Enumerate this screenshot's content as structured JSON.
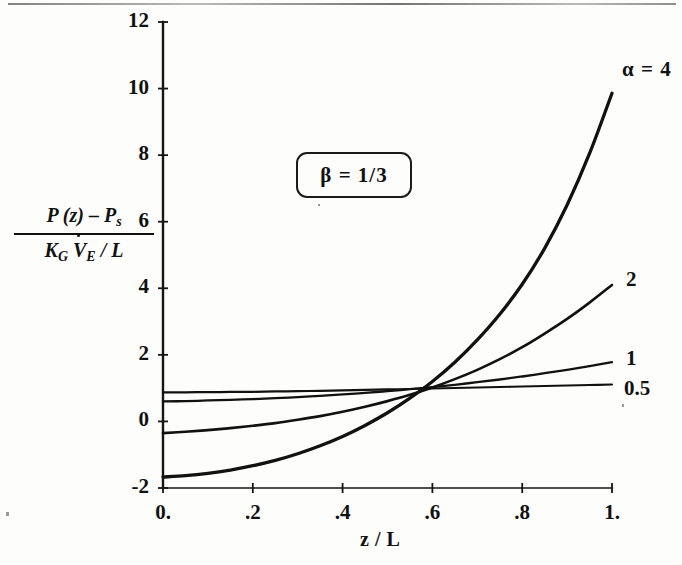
{
  "figure": {
    "background_color": "#fdfdfb",
    "ink_color": "#111111"
  },
  "chart_data": {
    "type": "line",
    "title": "",
    "subtitle": "",
    "xlabel": "z / L",
    "ylabel": "( P(z) - P_s ) / ( K_G V_E_dot / L )",
    "ylabel_numerator": "P (z) – P",
    "ylabel_numerator_sub": "s",
    "ylabel_denominator_k": "K",
    "ylabel_denominator_k_sub": "G",
    "ylabel_denominator_v": "V",
    "ylabel_denominator_v_sub": "E",
    "ylabel_denominator_tail": "/  L",
    "xlim": [
      0,
      1
    ],
    "ylim": [
      -2,
      12
    ],
    "grid": false,
    "legend_position": "right-inline-labels",
    "xticks": [
      0,
      0.2,
      0.4,
      0.6,
      0.8,
      1
    ],
    "xtick_labels": [
      "0.",
      ".2",
      ".4",
      ".6",
      ".8",
      "1."
    ],
    "yticks": [
      -2,
      0,
      2,
      4,
      6,
      8,
      10,
      12
    ],
    "ytick_labels": [
      "-2",
      "0",
      "2",
      "4",
      "6",
      "8",
      "10",
      "12"
    ],
    "annotation_box": "β  =  1/3",
    "annotation_box_symbol": "β",
    "annotation_box_text": "=  1/3",
    "parameter_symbol": "α",
    "x": [
      0,
      0.05,
      0.1,
      0.15,
      0.2,
      0.25,
      0.3,
      0.35,
      0.4,
      0.45,
      0.5,
      0.55,
      0.6,
      0.65,
      0.7,
      0.75,
      0.8,
      0.85,
      0.9,
      0.95,
      1
    ],
    "series": [
      {
        "name": "α = 4",
        "label": "α  =  4",
        "alpha": 4,
        "values": [
          -1.67,
          -1.63,
          -1.56,
          -1.46,
          -1.33,
          -1.17,
          -0.97,
          -0.73,
          -0.45,
          -0.12,
          0.26,
          0.7,
          1.2,
          1.78,
          2.45,
          3.22,
          4.12,
          5.2,
          6.5,
          8.05,
          9.86
        ]
      },
      {
        "name": "α = 2",
        "label": "2",
        "alpha": 2,
        "values": [
          -0.35,
          -0.31,
          -0.26,
          -0.2,
          -0.13,
          -0.05,
          0.05,
          0.16,
          0.29,
          0.44,
          0.61,
          0.8,
          1.02,
          1.27,
          1.55,
          1.87,
          2.23,
          2.64,
          3.08,
          3.57,
          4.1
        ]
      },
      {
        "name": "α = 1",
        "label": "1",
        "alpha": 1,
        "values": [
          0.6,
          0.61,
          0.63,
          0.65,
          0.67,
          0.7,
          0.73,
          0.77,
          0.81,
          0.86,
          0.91,
          0.97,
          1.03,
          1.1,
          1.18,
          1.26,
          1.35,
          1.45,
          1.55,
          1.66,
          1.78
        ]
      },
      {
        "name": "α = 0.5",
        "label": "0.5",
        "alpha": 0.5,
        "values": [
          0.87,
          0.875,
          0.88,
          0.885,
          0.89,
          0.9,
          0.91,
          0.92,
          0.93,
          0.945,
          0.96,
          0.975,
          0.99,
          1.005,
          1.02,
          1.035,
          1.05,
          1.065,
          1.08,
          1.095,
          1.11
        ]
      }
    ]
  },
  "geometry": {
    "plot_left_px": 163,
    "plot_right_px": 612,
    "plot_bottom_px": 488,
    "plot_top_px": 22
  }
}
